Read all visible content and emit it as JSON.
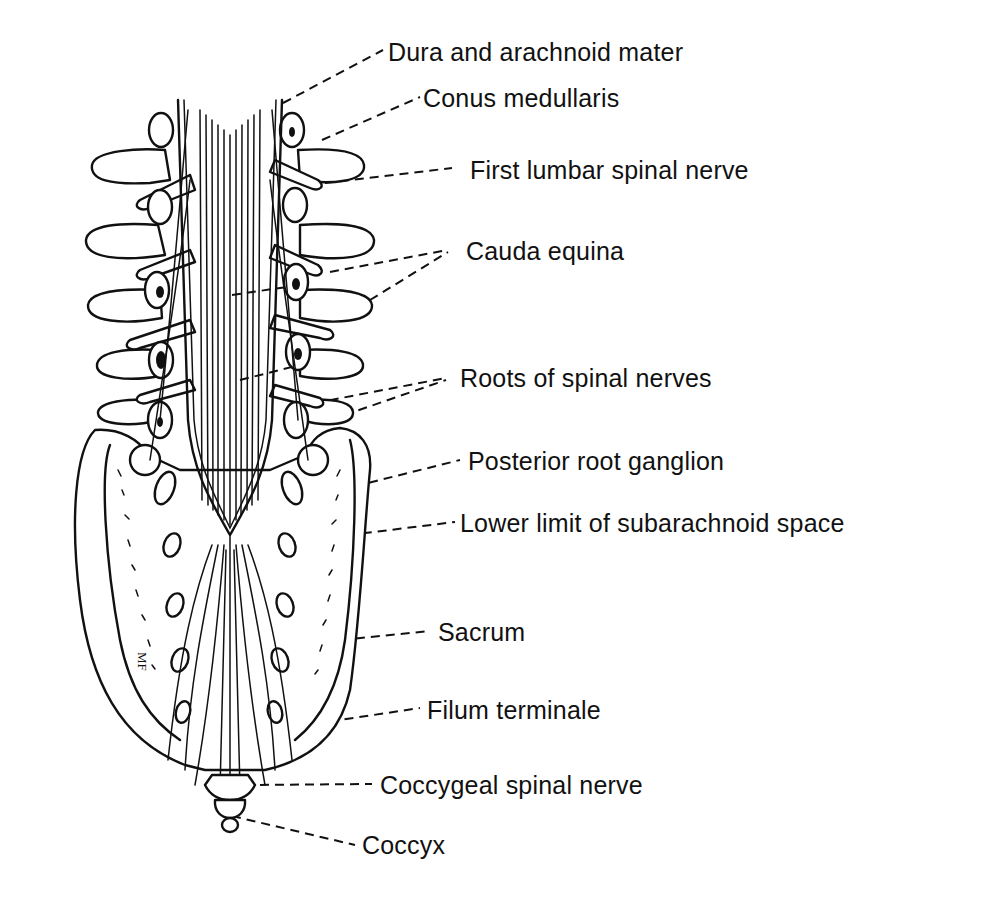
{
  "figure": {
    "artist_initials": "MF",
    "colors": {
      "ink": "#111111",
      "background": "#ffffff"
    },
    "labels": [
      {
        "id": "dura",
        "text": "Dura and arachnoid mater",
        "x": 388,
        "y": 40
      },
      {
        "id": "conus",
        "text": "Conus medullaris",
        "x": 423,
        "y": 86
      },
      {
        "id": "first-lumbar",
        "text": "First lumbar spinal nerve",
        "x": 470,
        "y": 158
      },
      {
        "id": "cauda",
        "text": "Cauda equina",
        "x": 466,
        "y": 239
      },
      {
        "id": "roots",
        "text": "Roots of spinal nerves",
        "x": 460,
        "y": 366
      },
      {
        "id": "ganglion",
        "text": "Posterior root ganglion",
        "x": 468,
        "y": 449
      },
      {
        "id": "subarachnoid",
        "text": "Lower limit of subarachnoid space",
        "x": 460,
        "y": 511
      },
      {
        "id": "sacrum",
        "text": "Sacrum",
        "x": 438,
        "y": 620
      },
      {
        "id": "filum",
        "text": "Filum terminale",
        "x": 427,
        "y": 698
      },
      {
        "id": "coccygeal",
        "text": "Coccygeal spinal nerve",
        "x": 380,
        "y": 773
      },
      {
        "id": "coccyx",
        "text": "Coccyx",
        "x": 362,
        "y": 833
      }
    ]
  }
}
